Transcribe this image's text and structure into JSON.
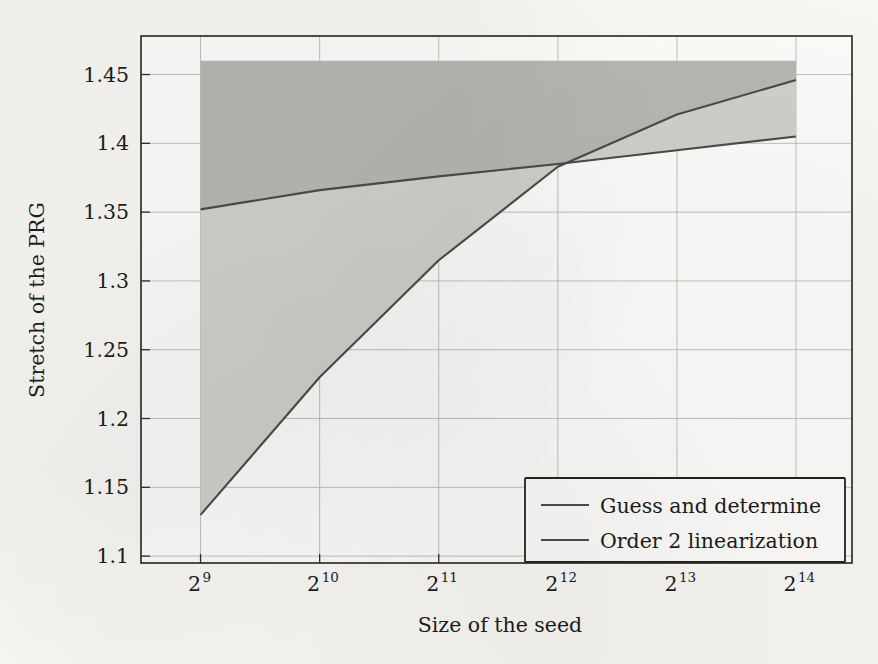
{
  "chart_data": {
    "type": "line",
    "title": "",
    "xlabel": "Size of the seed",
    "ylabel": "Stretch of the PRG",
    "x_scale": "log2",
    "x_tick_values": [
      512,
      1024,
      2048,
      4096,
      8192,
      16384
    ],
    "x_tick_labels": [
      "2^9",
      "2^10",
      "2^11",
      "2^12",
      "2^13",
      "2^14"
    ],
    "x_tick_bases": [
      "2",
      "2",
      "2",
      "2",
      "2",
      "2"
    ],
    "x_tick_exponents": [
      "9",
      "10",
      "11",
      "12",
      "13",
      "14"
    ],
    "xlim_exp": [
      8.5,
      14.47
    ],
    "y_tick_labels": [
      "1.1",
      "1.15",
      "1.2",
      "1.25",
      "1.3",
      "1.35",
      "1.4",
      "1.45"
    ],
    "y_tick_values": [
      1.1,
      1.15,
      1.2,
      1.25,
      1.3,
      1.35,
      1.4,
      1.45
    ],
    "ylim": [
      1.095,
      1.478
    ],
    "grid": true,
    "legend_position": "lower-right",
    "series": [
      {
        "name": "Guess and determine",
        "color": "#4a4a48",
        "x_exp": [
          9,
          10,
          11,
          12,
          13,
          14
        ],
        "values": [
          1.13,
          1.23,
          1.315,
          1.383,
          1.421,
          1.446
        ]
      },
      {
        "name": "Order 2 linearization",
        "color": "#cfcecb",
        "x_exp": [
          9,
          10,
          11,
          12,
          13,
          14
        ],
        "values": [
          1.352,
          1.366,
          1.376,
          1.385,
          1.395,
          1.405
        ]
      }
    ],
    "shaded_bands": [
      {
        "name": "upper-dark-band",
        "color": "#b6b5b2",
        "top_value": 1.46,
        "bottom_series": "Guess and determine"
      },
      {
        "name": "lower-light-band",
        "color": "#cfcecb",
        "top_series": "Order 2 linearization",
        "bottom_series": "Guess and determine"
      }
    ],
    "annotations": []
  },
  "legend": {
    "entries": [
      {
        "label": "Guess and determine"
      },
      {
        "label": "Order 2 linearization"
      }
    ]
  },
  "axes": {
    "y_title": "Stretch of the PRG",
    "x_title": "Size of the seed"
  }
}
